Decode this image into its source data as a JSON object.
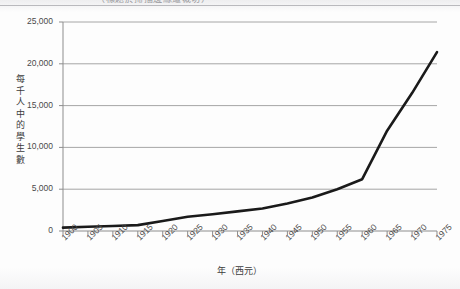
{
  "figure": {
    "background": "#fdfdfd",
    "title_clipped": "（標題於掃描邊緣遭裁切）"
  },
  "axes": {
    "y_title": "每千人中的學生數",
    "x_title": "年（西元）",
    "grid_color": "#9c9c9c",
    "line_color": "#1a1a1a"
  },
  "chart_data": {
    "type": "line",
    "title": "",
    "xlabel": "年（西元）",
    "ylabel": "每千人中的學生數",
    "xlim": [
      1900,
      1975
    ],
    "ylim": [
      0,
      25000
    ],
    "grid": true,
    "legend": "none",
    "x_tick_labels": [
      "1900",
      "1905",
      "1910",
      "1915",
      "1920",
      "1925",
      "1930",
      "1935",
      "1940",
      "1945",
      "1950",
      "1955",
      "1960",
      "1965",
      "1970",
      "1975"
    ],
    "y_tick_labels": [
      "0",
      "5,000",
      "10,000",
      "15,000",
      "20,000",
      "25,000"
    ],
    "y_ticks": [
      0,
      5000,
      10000,
      15000,
      20000,
      25000
    ],
    "x": [
      1900,
      1905,
      1910,
      1915,
      1920,
      1925,
      1930,
      1935,
      1940,
      1945,
      1950,
      1955,
      1960,
      1965,
      1970,
      1975
    ],
    "values": [
      400,
      500,
      600,
      700,
      1200,
      1700,
      2000,
      2350,
      2700,
      3300,
      4000,
      5000,
      6200,
      12000,
      16500,
      21400
    ],
    "series": [
      {
        "name": "每千人中的學生數",
        "values": [
          400,
          500,
          600,
          700,
          1200,
          1700,
          2000,
          2350,
          2700,
          3300,
          4000,
          5000,
          6200,
          12000,
          16500,
          21400
        ]
      }
    ]
  }
}
